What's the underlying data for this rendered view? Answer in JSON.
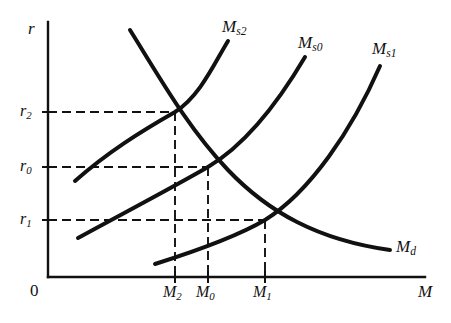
{
  "figure": {
    "type": "line-diagram",
    "domain": "economics-money-market",
    "background": "#ffffff",
    "ink": "#111111"
  },
  "axes": {
    "y_label": "r",
    "x_label": "M",
    "origin_label": "0",
    "x_axis": {
      "x_start": 48,
      "x_end": 425,
      "y": 277
    },
    "y_axis": {
      "y_top": 22,
      "y_bottom": 277,
      "x": 48
    },
    "y_ticks": [
      {
        "label_main": "r",
        "label_sub": "2",
        "y": 112
      },
      {
        "label_main": "r",
        "label_sub": "0",
        "y": 167
      },
      {
        "label_main": "r",
        "label_sub": "1",
        "y": 220
      }
    ],
    "x_ticks": [
      {
        "label_main": "M",
        "label_sub": "2",
        "x": 175
      },
      {
        "label_main": "M",
        "label_sub": "0",
        "x": 208
      },
      {
        "label_main": "M",
        "label_sub": "1",
        "x": 265
      }
    ]
  },
  "curves": [
    {
      "name": "money-demand",
      "label_main": "M",
      "label_sub": "d",
      "label_x": 396,
      "label_y": 248,
      "path": "M 130,30 C 160,78 188,128 228,170 C 268,212 318,240 390,250"
    },
    {
      "name": "money-supply-2",
      "label_main": "M",
      "label_sub": "s2",
      "label_x": 222,
      "label_y": 30,
      "path": "M 75,181 C 108,152 140,132 175,112 C 200,96 214,64 228,41"
    },
    {
      "name": "money-supply-0",
      "label_main": "M",
      "label_sub": "s0",
      "label_x": 300,
      "label_y": 46,
      "path": "M 78,238 C 120,215 168,190 208,167 C 250,142 282,96 305,57"
    },
    {
      "name": "money-supply-1",
      "label_main": "M",
      "label_sub": "s1",
      "label_x": 374,
      "label_y": 52,
      "path": "M 155,264 C 196,251 238,236 265,220 C 310,192 352,130 380,66"
    }
  ],
  "equilibria": [
    {
      "name": "equilibrium-2",
      "x": 175,
      "y": 112,
      "rate": "r2",
      "quantity": "M2"
    },
    {
      "name": "equilibrium-0",
      "x": 208,
      "y": 167,
      "rate": "r0",
      "quantity": "M0"
    },
    {
      "name": "equilibrium-1",
      "x": 265,
      "y": 220,
      "rate": "r1",
      "quantity": "M1"
    }
  ],
  "guides": [
    {
      "name": "guide-h-r2",
      "x1": 48,
      "y1": 112,
      "x2": 175,
      "y2": 112
    },
    {
      "name": "guide-h-r0",
      "x1": 48,
      "y1": 167,
      "x2": 208,
      "y2": 167
    },
    {
      "name": "guide-h-r1",
      "x1": 48,
      "y1": 220,
      "x2": 265,
      "y2": 220
    },
    {
      "name": "guide-v-m2",
      "x1": 175,
      "y1": 112,
      "x2": 175,
      "y2": 277
    },
    {
      "name": "guide-v-m0",
      "x1": 208,
      "y1": 167,
      "x2": 208,
      "y2": 277
    },
    {
      "name": "guide-v-m1",
      "x1": 265,
      "y1": 220,
      "x2": 265,
      "y2": 277
    }
  ]
}
